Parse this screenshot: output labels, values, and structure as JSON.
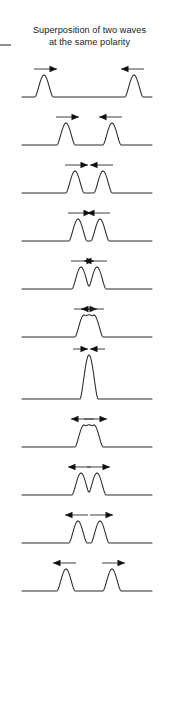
{
  "figure": {
    "name": "wave-superposition-sequence",
    "title_lines": [
      "Superposition of two waves",
      "at the same polarity"
    ],
    "title_full": "Superposition of two waves at the same polarity",
    "colors": {
      "background": "#ffffff",
      "wave_stroke": "#2b2b2b",
      "arrow": "#111111",
      "title_text": "#1a1a1a",
      "margin_dash": "#8e8e8e"
    },
    "margin_dash_label": "page-margin-tick"
  },
  "chart_data": {
    "type": "line",
    "title": "Superposition of two waves at the same polarity",
    "subtitle": "",
    "xlabel": "",
    "ylabel": "",
    "grid": false,
    "legend": "none",
    "xlim": [
      0,
      179
    ],
    "ylim": [
      0,
      2
    ],
    "baseline_amplitude": 1,
    "peak_amplitude": 2,
    "frames": [
      {
        "index": 1,
        "label": "frame-1-far-apart-approaching",
        "stage": "approaching",
        "pulses": [
          {
            "center": 44,
            "amplitude": 1,
            "direction": "right"
          },
          {
            "center": 134,
            "amplitude": 1,
            "direction": "left"
          }
        ],
        "separation": 90,
        "peak_amplitude": 1,
        "arrow_mode": "inward"
      },
      {
        "index": 2,
        "label": "frame-2-closer-approaching",
        "stage": "approaching",
        "pulses": [
          {
            "center": 66,
            "amplitude": 1,
            "direction": "right"
          },
          {
            "center": 112,
            "amplitude": 1,
            "direction": "left"
          }
        ],
        "separation": 46,
        "peak_amplitude": 1,
        "arrow_mode": "inward"
      },
      {
        "index": 3,
        "label": "frame-3-nearly-touching",
        "stage": "approaching",
        "pulses": [
          {
            "center": 75,
            "amplitude": 1,
            "direction": "right"
          },
          {
            "center": 103,
            "amplitude": 1,
            "direction": "left"
          }
        ],
        "separation": 28,
        "peak_amplitude": 1,
        "arrow_mode": "inward"
      },
      {
        "index": 4,
        "label": "frame-4-beginning-overlap",
        "stage": "overlapping",
        "pulses": [
          {
            "center": 78,
            "amplitude": 1,
            "direction": "right"
          },
          {
            "center": 100,
            "amplitude": 1,
            "direction": "left"
          }
        ],
        "separation": 22,
        "peak_amplitude": 1.05,
        "valley_amplitude": 0.25,
        "arrow_mode": "inward"
      },
      {
        "index": 5,
        "label": "frame-5-partial-overlap",
        "stage": "overlapping",
        "pulses": [
          {
            "center": 81,
            "amplitude": 1,
            "direction": "right"
          },
          {
            "center": 97,
            "amplitude": 1,
            "direction": "left"
          }
        ],
        "separation": 16,
        "peak_amplitude": 1.15,
        "valley_amplitude": 0.55,
        "arrow_mode": "inward"
      },
      {
        "index": 6,
        "label": "frame-6-almost-merged",
        "stage": "overlapping",
        "pulses": [
          {
            "center": 84,
            "amplitude": 1,
            "direction": "right"
          },
          {
            "center": 94,
            "amplitude": 1,
            "direction": "left"
          }
        ],
        "separation": 10,
        "peak_amplitude": 1.4,
        "valley_amplitude": 1.1,
        "arrow_mode": "inward"
      },
      {
        "index": 7,
        "label": "frame-7-constructive-interference-peak",
        "stage": "fully-superposed",
        "pulses": [
          {
            "center": 89,
            "amplitude": 2,
            "direction": "right"
          },
          {
            "center": 89,
            "amplitude": 2,
            "direction": "left"
          }
        ],
        "separation": 0,
        "peak_amplitude": 2,
        "arrow_mode": "inward"
      },
      {
        "index": 8,
        "label": "frame-8-beginning-separation",
        "stage": "separating",
        "pulses": [
          {
            "center": 84,
            "amplitude": 1,
            "direction": "left"
          },
          {
            "center": 94,
            "amplitude": 1,
            "direction": "right"
          }
        ],
        "separation": 10,
        "peak_amplitude": 1.4,
        "valley_amplitude": 1.1,
        "arrow_mode": "outward"
      },
      {
        "index": 9,
        "label": "frame-9-partial-separation",
        "stage": "separating",
        "pulses": [
          {
            "center": 81,
            "amplitude": 1,
            "direction": "left"
          },
          {
            "center": 97,
            "amplitude": 1,
            "direction": "right"
          }
        ],
        "separation": 16,
        "peak_amplitude": 1.15,
        "valley_amplitude": 0.55,
        "arrow_mode": "outward"
      },
      {
        "index": 10,
        "label": "frame-10-separated-twin-peaks",
        "stage": "separating",
        "pulses": [
          {
            "center": 78,
            "amplitude": 1,
            "direction": "left"
          },
          {
            "center": 100,
            "amplitude": 1,
            "direction": "right"
          }
        ],
        "separation": 22,
        "peak_amplitude": 1.05,
        "valley_amplitude": 0.2,
        "arrow_mode": "outward"
      },
      {
        "index": 11,
        "label": "frame-11-moving-apart",
        "stage": "separating",
        "pulses": [
          {
            "center": 66,
            "amplitude": 1,
            "direction": "left"
          },
          {
            "center": 112,
            "amplitude": 1,
            "direction": "right"
          }
        ],
        "separation": 46,
        "peak_amplitude": 1,
        "arrow_mode": "outward"
      }
    ]
  }
}
